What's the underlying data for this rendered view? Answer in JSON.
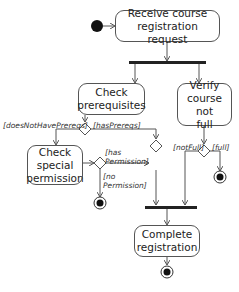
{
  "diagram": {
    "type": "UML activity diagram",
    "actions": [
      {
        "id": "receive",
        "label": "Receive course\nregistration request"
      },
      {
        "id": "prereqs",
        "label": "Check\nprerequisites"
      },
      {
        "id": "verify",
        "label": "Verify\ncourse not\nfull"
      },
      {
        "id": "special",
        "label": "Check\nspecial\npermission"
      },
      {
        "id": "complete",
        "label": "Complete\nregistration"
      }
    ],
    "guards": {
      "doesNotHavePrereqs": "[doesNotHavePrereqs]",
      "hasPrereqs": "[hasPrereqs]",
      "hasPermission": "[has\nPermission]",
      "noPermission": "[no\nPermission]",
      "notFull": "[notFull]",
      "full": "[full]"
    },
    "colors": {
      "line": "#555555",
      "bar": "#222222",
      "node_fill": "#ffffff"
    }
  }
}
